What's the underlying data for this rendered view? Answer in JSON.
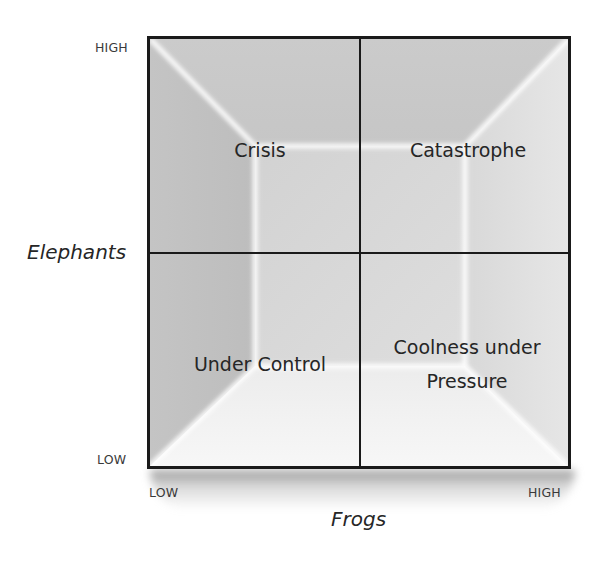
{
  "diagram": {
    "type": "2x2-matrix",
    "x_axis": {
      "title": "Frogs",
      "low_label": "LOW",
      "high_label": "HIGH"
    },
    "y_axis": {
      "title": "Elephants",
      "low_label": "LOW",
      "high_label": "HIGH"
    },
    "quadrants": {
      "top_left": {
        "label": "Crisis"
      },
      "top_right": {
        "label": "Catastrophe"
      },
      "bottom_left": {
        "label": "Under Control"
      },
      "bottom_right": {
        "label_line1": "Coolness under",
        "label_line2": "Pressure"
      }
    },
    "colors": {
      "border": "#1a1a1a",
      "fill_dark": "#b8b8b8",
      "fill_mid": "#cfcfcf",
      "fill_light": "#f4f4f4",
      "highlight": "#ffffff",
      "text": "#262626"
    }
  }
}
